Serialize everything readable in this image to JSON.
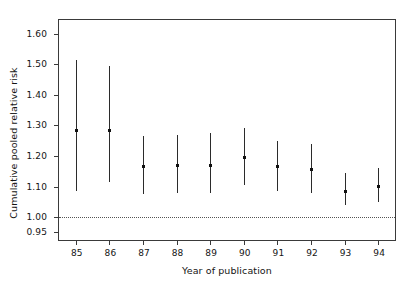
{
  "chart_data": {
    "type": "scatter",
    "title": "",
    "xlabel": "Year of publication",
    "ylabel": "Cumulative pooled relative risk",
    "categories": [
      "85",
      "86",
      "87",
      "88",
      "89",
      "90",
      "91",
      "92",
      "93",
      "94"
    ],
    "x_tick_labels": [
      "85",
      "86",
      "87",
      "88",
      "89",
      "90",
      "91",
      "92",
      "93",
      "94"
    ],
    "y_tick_labels": [
      "0.95",
      "1.00",
      "1.10",
      "1.20",
      "1.30",
      "1.40",
      "1.50",
      "1.60"
    ],
    "y_tick_values": [
      0.95,
      1.0,
      1.1,
      1.2,
      1.3,
      1.4,
      1.5,
      1.6
    ],
    "ylim": [
      0.925,
      1.645
    ],
    "grid": false,
    "legend": null,
    "reference_line": {
      "value": 1.0,
      "style": "dotted",
      "orientation": "horizontal"
    },
    "series": [
      {
        "name": "Cumulative pooled relative risk",
        "marker": "square",
        "error_bars": "95% confidence interval",
        "values": [
          1.285,
          1.285,
          1.165,
          1.17,
          1.17,
          1.195,
          1.165,
          1.155,
          1.085,
          1.1
        ],
        "lower": [
          1.085,
          1.115,
          1.075,
          1.08,
          1.08,
          1.105,
          1.085,
          1.08,
          1.04,
          1.05
        ],
        "upper": [
          1.515,
          1.495,
          1.265,
          1.27,
          1.275,
          1.29,
          1.25,
          1.24,
          1.145,
          1.16
        ]
      }
    ],
    "points": [
      {
        "year": "85",
        "value": 1.285,
        "lower": 1.085,
        "upper": 1.515
      },
      {
        "year": "86",
        "value": 1.285,
        "lower": 1.115,
        "upper": 1.495
      },
      {
        "year": "87",
        "value": 1.165,
        "lower": 1.075,
        "upper": 1.265
      },
      {
        "year": "88",
        "value": 1.17,
        "lower": 1.08,
        "upper": 1.27
      },
      {
        "year": "89",
        "value": 1.17,
        "lower": 1.08,
        "upper": 1.275
      },
      {
        "year": "90",
        "value": 1.195,
        "lower": 1.105,
        "upper": 1.29
      },
      {
        "year": "91",
        "value": 1.165,
        "lower": 1.085,
        "upper": 1.25
      },
      {
        "year": "92",
        "value": 1.155,
        "lower": 1.08,
        "upper": 1.24
      },
      {
        "year": "93",
        "value": 1.085,
        "lower": 1.04,
        "upper": 1.145
      },
      {
        "year": "94",
        "value": 1.1,
        "lower": 1.05,
        "upper": 1.16
      }
    ],
    "colors": {
      "axis": "#3a3a3a",
      "marker": "#111111",
      "error_bar": "#2b2b2b",
      "reference_line": "#555555",
      "background": "#ffffff",
      "text": "#141414"
    }
  }
}
